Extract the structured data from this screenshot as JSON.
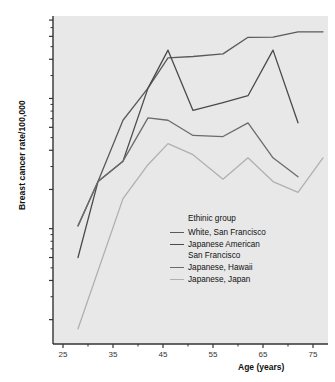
{
  "chart_data": {
    "type": "line",
    "title": "",
    "xlabel": "Age (years)",
    "ylabel": "Breast cancer rate/100,000",
    "xlim": [
      23,
      78
    ],
    "ylim": [
      1.3,
      430
    ],
    "yscale": "log",
    "xscale": "linear",
    "grid": false,
    "legend_position": "center-right-inside",
    "legend_title": "Ethinic group",
    "xticks": [
      25,
      35,
      45,
      55,
      65,
      75
    ],
    "xtick_labels": [
      "25",
      "35",
      "45",
      "55",
      "65",
      "75"
    ],
    "xminor_ticks": [
      30,
      40,
      50,
      60,
      70
    ],
    "yticks": [
      2,
      4,
      6,
      10,
      20,
      40,
      60,
      100,
      200,
      300,
      400
    ],
    "ytick_labels": [
      "2",
      "4",
      "6",
      "10",
      "20",
      "40",
      "60",
      "100",
      "200",
      "300",
      "400"
    ],
    "yminor_ticks": [
      3,
      5,
      7,
      8,
      9,
      30,
      50,
      70,
      80,
      90,
      150,
      250,
      350
    ],
    "series": [
      {
        "name": "White, San Francisco",
        "color": "#5a5a5a",
        "width": 1.3,
        "x": [
          28,
          32,
          37,
          42,
          46,
          51,
          57,
          62,
          67,
          72,
          77
        ],
        "values": [
          10.5,
          23,
          68,
          120,
          205,
          210,
          220,
          295,
          296,
          325,
          325
        ]
      },
      {
        "name": "Japanese American San Francisco",
        "color": "#4a4a4a",
        "width": 1.3,
        "x": [
          28,
          32,
          37,
          42,
          46,
          51,
          57,
          62,
          67,
          72
        ],
        "values": [
          6.0,
          23,
          33,
          120,
          235,
          81,
          93,
          105,
          235,
          65
        ]
      },
      {
        "name": "Japanese, Hawaii",
        "color": "#6b6b6b",
        "width": 1.3,
        "x": [
          28,
          32,
          37,
          42,
          46,
          51,
          57,
          62,
          67,
          72
        ],
        "values": [
          10.5,
          23,
          33,
          71,
          68,
          52,
          51,
          65,
          35,
          25
        ]
      },
      {
        "name": "Japanese, Japan",
        "color": "#b0b0b0",
        "width": 1.3,
        "x": [
          28,
          37,
          42,
          46,
          51,
          57,
          62,
          67,
          72,
          77
        ],
        "values": [
          1.7,
          17,
          31,
          45,
          37,
          24,
          35,
          23,
          19,
          35
        ]
      }
    ]
  },
  "legend": {
    "title": "Ethinic group",
    "entries": [
      {
        "label": "White, San Francisco",
        "continuation": ""
      },
      {
        "label": "Japanese American",
        "continuation": "San Francisco"
      },
      {
        "label": "Japanese, Hawaii",
        "continuation": ""
      },
      {
        "label": "Japanese, Japan",
        "continuation": ""
      }
    ]
  },
  "axes": {
    "x_title": "Age (years)",
    "y_title": "Breast cancer rate/100,000"
  },
  "style": {
    "plot_background": "#e8e8e8",
    "page_background": "#ffffff",
    "axis_color": "#333333",
    "tick_label_color": "#333333"
  }
}
